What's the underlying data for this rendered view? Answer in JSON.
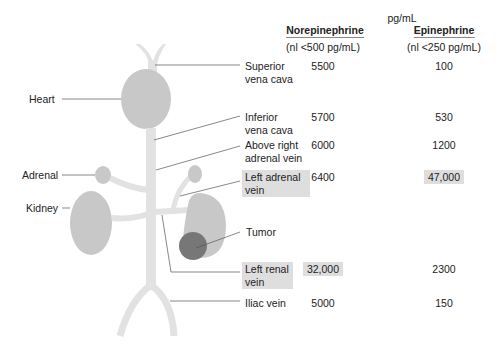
{
  "units_label": "pg/mL",
  "columns": [
    {
      "name": "Norepinephrine",
      "normal": "(nl <500 pg/mL)"
    },
    {
      "name": "Epinephrine",
      "normal": "(nl <250 pg/mL)"
    }
  ],
  "anatomy_labels": {
    "heart": "Heart",
    "adrenal": "Adrenal",
    "kidney": "Kidney",
    "tumor": "Tumor"
  },
  "rows": [
    {
      "site_line1": "Superior",
      "site_line2": "vena cava",
      "norepinephrine": "5500",
      "epinephrine": "100",
      "highlight_site": false,
      "highlight_ne": false,
      "highlight_epi": false
    },
    {
      "site_line1": "Inferior",
      "site_line2": "vena cava",
      "norepinephrine": "5700",
      "epinephrine": "530",
      "highlight_site": false,
      "highlight_ne": false,
      "highlight_epi": false
    },
    {
      "site_line1": "Above right",
      "site_line2": "adrenal vein",
      "norepinephrine": "6000",
      "epinephrine": "1200",
      "highlight_site": false,
      "highlight_ne": false,
      "highlight_epi": false
    },
    {
      "site_line1": "Left adrenal",
      "site_line2": "vein",
      "norepinephrine": "6400",
      "epinephrine": "47,000",
      "highlight_site": true,
      "highlight_ne": false,
      "highlight_epi": true
    },
    {
      "site_line1": "Left renal",
      "site_line2": "vein",
      "norepinephrine": "32,000",
      "epinephrine": "2300",
      "highlight_site": true,
      "highlight_ne": true,
      "highlight_epi": false
    },
    {
      "site_line1": "Iliac vein",
      "site_line2": "",
      "norepinephrine": "5000",
      "epinephrine": "150",
      "highlight_site": false,
      "highlight_ne": false,
      "highlight_epi": false
    }
  ],
  "colors": {
    "organ": "#c8c8c8",
    "vessel": "#e2e2e2",
    "tumor": "#777777",
    "highlight": "#dedede",
    "leader_line": "#555555"
  }
}
